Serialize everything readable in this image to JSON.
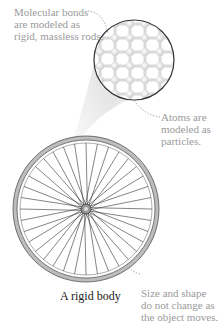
{
  "figure": {
    "title": "A rigid body",
    "labels": {
      "bonds": [
        "Molecular bonds",
        "are modeled as",
        "rigid, massless rods."
      ],
      "atoms": [
        "Atoms are",
        "modeled as",
        "particles."
      ],
      "shape": [
        "Size and shape",
        "do not change as",
        "the object moves."
      ]
    },
    "colors": {
      "annotation_text": "#9a9a9a",
      "caption_text": "#222222",
      "wheel_stroke": "#555555",
      "rim_fill": "#bdbdbd",
      "lattice": "#d9d9d9"
    },
    "wheel": {
      "spokes": 36
    }
  }
}
